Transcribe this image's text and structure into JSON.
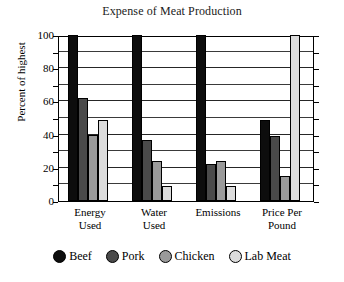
{
  "chart_data": {
    "type": "bar",
    "title": "Expense of Meat Production",
    "xlabel": "",
    "ylabel": "Percent of highest",
    "categories": [
      "Energy Used",
      "Water Used",
      "Emissions",
      "Price Per Pound"
    ],
    "category_lines": [
      [
        "Energy",
        "Used"
      ],
      [
        "Water",
        "Used"
      ],
      [
        "Emissions",
        ""
      ],
      [
        "Price Per",
        "Pound"
      ]
    ],
    "series": [
      {
        "name": "Beef",
        "color": "#0d0d0d",
        "values": [
          100,
          100,
          100,
          49
        ]
      },
      {
        "name": "Pork",
        "color": "#4a4a4a",
        "values": [
          62,
          37,
          22,
          39
        ]
      },
      {
        "name": "Chicken",
        "color": "#9a9a9a",
        "values": [
          40,
          24,
          24,
          15
        ]
      },
      {
        "name": "Lab Meat",
        "color": "#dcdcdc",
        "values": [
          49,
          9,
          9,
          100
        ]
      }
    ],
    "ylim": [
      0,
      100
    ],
    "yticks": [
      0,
      20,
      40,
      60,
      80,
      100
    ],
    "ytick_labels": [
      "0",
      "20",
      "40",
      "60",
      "80",
      "100"
    ],
    "minor_tick_step": 10,
    "grid": true,
    "legend_position": "bottom"
  }
}
